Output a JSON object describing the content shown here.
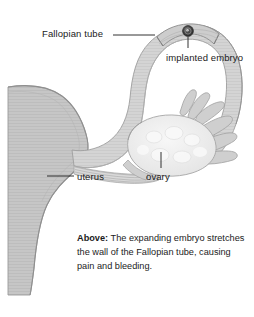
{
  "figure": {
    "name": "ectopic-pregnancy-fallopian-tube-diagram",
    "background_color": "#ffffff"
  },
  "labels": {
    "fallopian_tube": "Fallopian tube",
    "implanted_embryo": "implanted embryo",
    "uterus": "uterus",
    "ovary": "ovary"
  },
  "caption": {
    "lead": "Above:",
    "body": " The expanding embryo stretches the wall of the Fallopian tube, causing pain and bleeding."
  },
  "colors": {
    "uterus_fill": "#c6c6c6",
    "uterus_edge": "#9a9a9a",
    "tube_wall_fill": "#d2d2d2",
    "tube_wall_edge": "#9e9e9e",
    "tube_lumen_fill": "#ffffff",
    "ovary_fill": "#ededed",
    "ovary_edge": "#a6a6a6",
    "fimbriae_fill": "#cfcfcf",
    "embryo_fill": "#3a3a3a",
    "leader_line": "#1b1b1b",
    "text": "#1b1b1b"
  },
  "icon_names": {
    "embryo": "embryo-dot-icon",
    "leader": "leader-line-icon"
  }
}
